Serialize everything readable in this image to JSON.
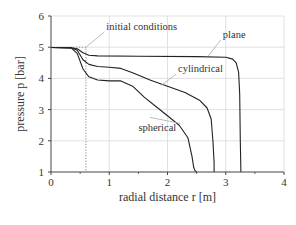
{
  "chart_data": {
    "type": "line",
    "title": "",
    "xlabel": "radial distance r [m]",
    "ylabel": "pressure p [bar]",
    "xlim": [
      0,
      4
    ],
    "ylim": [
      1,
      6
    ],
    "xticks": [
      0,
      1,
      2,
      3,
      4
    ],
    "yticks": [
      1,
      2,
      3,
      4,
      5,
      6
    ],
    "grid": true,
    "legend": "none (inline annotations)",
    "series": [
      {
        "name": "initial conditions",
        "style": "dotted",
        "x": [
          0,
          0.6,
          0.6
        ],
        "y": [
          5.0,
          5.0,
          1.0
        ]
      },
      {
        "name": "plane",
        "style": "solid",
        "x": [
          0,
          0.35,
          0.45,
          0.55,
          0.65,
          0.8,
          1.5,
          2.5,
          3.0,
          3.12,
          3.18,
          3.22,
          3.24,
          3.25,
          3.26
        ],
        "y": [
          4.99,
          4.98,
          4.95,
          4.82,
          4.74,
          4.72,
          4.71,
          4.7,
          4.68,
          4.62,
          4.5,
          4.2,
          3.5,
          2.0,
          1.0
        ]
      },
      {
        "name": "cylindrical",
        "style": "solid",
        "x": [
          0,
          0.35,
          0.45,
          0.55,
          0.65,
          0.8,
          1.0,
          1.2,
          1.4,
          1.7,
          2.0,
          2.3,
          2.55,
          2.68,
          2.75,
          2.78,
          2.8,
          2.8
        ],
        "y": [
          4.99,
          4.98,
          4.9,
          4.6,
          4.45,
          4.38,
          4.36,
          4.32,
          4.18,
          3.95,
          3.75,
          3.55,
          3.3,
          3.05,
          2.7,
          2.0,
          1.3,
          1.0
        ]
      },
      {
        "name": "spherical",
        "style": "solid",
        "x": [
          0,
          0.35,
          0.45,
          0.55,
          0.65,
          0.8,
          1.0,
          1.2,
          1.4,
          1.6,
          1.8,
          2.0,
          2.2,
          2.35,
          2.42,
          2.45,
          2.47,
          2.5
        ],
        "y": [
          4.99,
          4.97,
          4.8,
          4.3,
          4.05,
          3.95,
          3.92,
          3.92,
          3.75,
          3.4,
          3.1,
          2.8,
          2.5,
          2.1,
          1.5,
          1.15,
          1.05,
          1.0
        ]
      }
    ],
    "annotations": [
      {
        "text": "initial conditions",
        "x": 0.95,
        "y": 5.55,
        "arrow_to": [
          0.6,
          5.0
        ]
      },
      {
        "text": "plane",
        "x": 2.95,
        "y": 5.3,
        "arrow_to": [
          2.7,
          4.72
        ]
      },
      {
        "text": "cylindrical",
        "x": 2.18,
        "y": 4.2,
        "arrow_to": [
          1.9,
          3.78
        ]
      },
      {
        "text": "spherical",
        "x": 1.5,
        "y": 2.3,
        "arrow_to": [
          1.7,
          2.75
        ]
      }
    ]
  },
  "colors": {
    "axis": "#444444",
    "grid": "#d9d9d9",
    "line": "#222222",
    "dotted": "#888888",
    "leader": "#aaaaaa",
    "text": "#333333"
  }
}
